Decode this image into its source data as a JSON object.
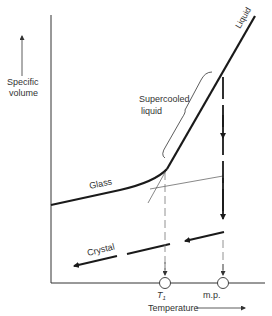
{
  "diagram": {
    "type": "volume-temperature phase diagram",
    "y_axis_label_line1": "Specific",
    "y_axis_label_line2": "volume",
    "x_axis_label": "Temperature",
    "labels": {
      "liquid": "Liquid",
      "supercooled_line1": "Supercooled",
      "supercooled_line2": "liquid",
      "glass": "Glass",
      "crystal": "Crystal",
      "tg": "T",
      "tg_sub": "1",
      "mp": "m.p."
    },
    "colors": {
      "line": "#1a1a1a",
      "thin_line": "#555555",
      "dashed": "#777777",
      "background": "#ffffff"
    }
  }
}
